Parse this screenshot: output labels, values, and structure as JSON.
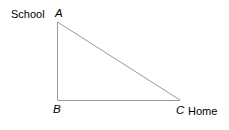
{
  "diagram": {
    "type": "right-triangle",
    "stroke_color": "#999999",
    "background_color": "#ffffff",
    "text_color": "#000000",
    "vertices": {
      "A": {
        "label": "A",
        "x": 57.5,
        "y": 22
      },
      "B": {
        "label": "B",
        "x": 57.5,
        "y": 100
      },
      "C": {
        "label": "C",
        "x": 180,
        "y": 100
      }
    },
    "annotations": {
      "school": "School",
      "home": "Home"
    },
    "edges": [
      {
        "name": "AB",
        "from": "A",
        "to": "B"
      },
      {
        "name": "BC",
        "from": "B",
        "to": "C"
      },
      {
        "name": "AC",
        "from": "A",
        "to": "C"
      }
    ]
  }
}
